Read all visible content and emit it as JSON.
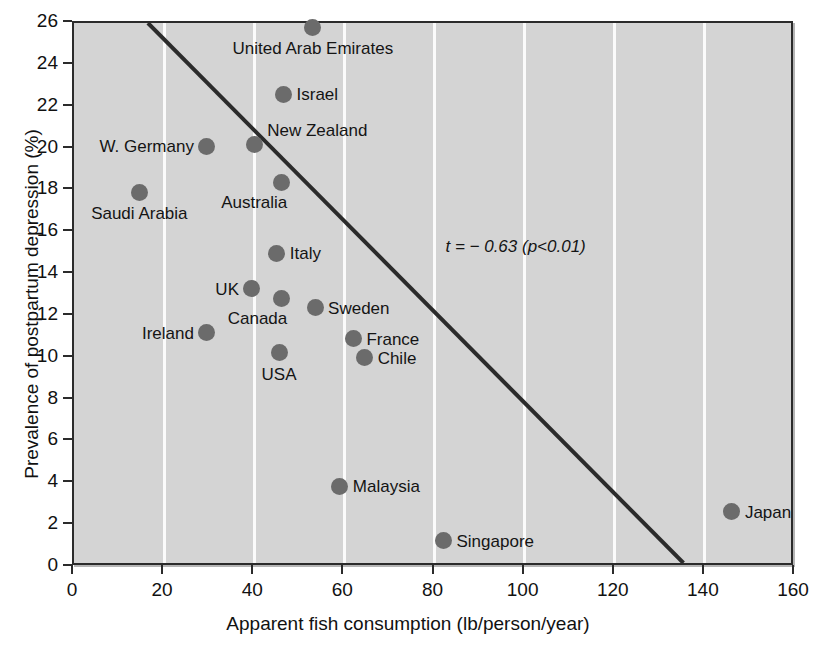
{
  "chart_data": {
    "type": "scatter",
    "title": "",
    "xlabel": "Apparent fish consumption (lb/person/year)",
    "ylabel": "Prevalence of postpartum depression (%)",
    "xlim": [
      0,
      160
    ],
    "ylim": [
      0,
      26
    ],
    "xticks": [
      0,
      20,
      40,
      60,
      80,
      100,
      120,
      140,
      160
    ],
    "yticks": [
      0,
      2,
      4,
      6,
      8,
      10,
      12,
      14,
      16,
      18,
      20,
      22,
      24,
      26
    ],
    "grid": "vertical-only",
    "legend": "none",
    "marker_color": "#6b6b6b",
    "background_color": "#d4d4d4",
    "gridline_color": "#fbfbfb",
    "axis_color": "#2b2b2b",
    "annotations": [
      {
        "text": "t = − 0.63 (p<0.01)",
        "x": 98,
        "y": 15.3
      }
    ],
    "trendline": {
      "color": "#2b2b2b",
      "x0": 16.5,
      "y0": 26.0,
      "x1": 136.0,
      "y1": 0.0
    },
    "points": [
      {
        "label": "United Arab Emirates",
        "x": 53.0,
        "y": 25.8,
        "label_pos": "below"
      },
      {
        "label": "Israel",
        "x": 46.5,
        "y": 22.6,
        "label_pos": "right"
      },
      {
        "label": "New Zealand",
        "x": 40.0,
        "y": 20.2,
        "label_pos": "above-right"
      },
      {
        "label": "W. Germany",
        "x": 29.5,
        "y": 20.1,
        "label_pos": "left"
      },
      {
        "label": "Australia",
        "x": 46.0,
        "y": 18.4,
        "label_pos": "below-left"
      },
      {
        "label": "Saudi Arabia",
        "x": 14.5,
        "y": 17.9,
        "label_pos": "below"
      },
      {
        "label": "Italy",
        "x": 45.0,
        "y": 15.0,
        "label_pos": "right"
      },
      {
        "label": "UK",
        "x": 39.5,
        "y": 13.3,
        "label_pos": "left"
      },
      {
        "label": "Canada",
        "x": 46.0,
        "y": 12.85,
        "label_pos": "below-left"
      },
      {
        "label": "Sweden",
        "x": 53.5,
        "y": 12.4,
        "label_pos": "right"
      },
      {
        "label": "Ireland",
        "x": 29.5,
        "y": 11.2,
        "label_pos": "left"
      },
      {
        "label": "France",
        "x": 62.0,
        "y": 10.9,
        "label_pos": "right"
      },
      {
        "label": "USA",
        "x": 45.5,
        "y": 10.25,
        "label_pos": "below"
      },
      {
        "label": "Chile",
        "x": 64.5,
        "y": 10.0,
        "label_pos": "right"
      },
      {
        "label": "Malaysia",
        "x": 59.0,
        "y": 3.85,
        "label_pos": "right"
      },
      {
        "label": "Singapore",
        "x": 82.0,
        "y": 1.25,
        "label_pos": "right"
      },
      {
        "label": "Japan",
        "x": 146.0,
        "y": 2.65,
        "label_pos": "right"
      }
    ]
  }
}
